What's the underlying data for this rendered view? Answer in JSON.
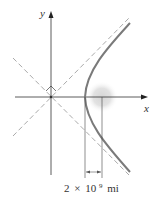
{
  "diagram": {
    "axes": {
      "x_label": "x",
      "y_label": "y"
    },
    "dimension": {
      "coef": "2",
      "times": "×",
      "base": "10",
      "exponent": "9",
      "unit": "mi"
    },
    "colors": {
      "axis": "#333333",
      "curve": "#777777",
      "asymptote": "#aaaaaa",
      "focus": "#cccccc"
    }
  }
}
